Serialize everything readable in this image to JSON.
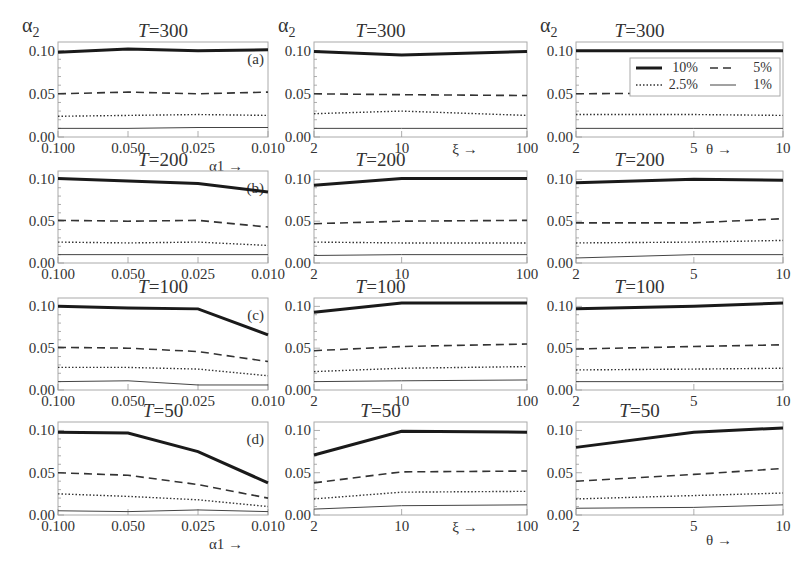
{
  "legend": {
    "entries": [
      {
        "label": "10%",
        "style": "thick-solid"
      },
      {
        "label": "5%",
        "style": "dashed"
      },
      {
        "label": "2.5%",
        "style": "dotted"
      },
      {
        "label": "1%",
        "style": "thin-solid"
      }
    ]
  },
  "y_axis_symbol": "α",
  "y_axis_subscript": "2",
  "y_ticks": [
    "0.00",
    "0.05",
    "0.10"
  ],
  "chart_data": [
    {
      "type": "line",
      "panel": "(a)",
      "title": "T=300",
      "title_T": "T",
      "title_val": "=300",
      "xlabel": "α1 →",
      "ylabel": "α2",
      "categories": [
        "0.100",
        "0.050",
        "0.025",
        "0.010"
      ],
      "ylim": [
        0,
        0.11
      ],
      "series": [
        {
          "name": "10%",
          "values": [
            0.098,
            0.102,
            0.1,
            0.101
          ]
        },
        {
          "name": "5%",
          "values": [
            0.05,
            0.052,
            0.05,
            0.052
          ]
        },
        {
          "name": "2.5%",
          "values": [
            0.024,
            0.025,
            0.026,
            0.025
          ]
        },
        {
          "name": "1%",
          "values": [
            0.01,
            0.01,
            0.011,
            0.011
          ]
        }
      ]
    },
    {
      "type": "line",
      "title": "T=300",
      "title_T": "T",
      "title_val": "=300",
      "xlabel": "ξ →",
      "ylabel": "α2",
      "categories": [
        "2",
        "10",
        "100"
      ],
      "ylim": [
        0,
        0.11
      ],
      "series": [
        {
          "name": "10%",
          "values": [
            0.099,
            0.095,
            0.099
          ]
        },
        {
          "name": "5%",
          "values": [
            0.05,
            0.049,
            0.048
          ]
        },
        {
          "name": "2.5%",
          "values": [
            0.027,
            0.03,
            0.025
          ]
        },
        {
          "name": "1%",
          "values": [
            0.01,
            0.01,
            0.01
          ]
        }
      ]
    },
    {
      "type": "line",
      "title": "T=300",
      "title_T": "T",
      "title_val": "=300",
      "xlabel": "θ →",
      "ylabel": "α2",
      "categories": [
        "2",
        "5",
        "10"
      ],
      "ylim": [
        0,
        0.11
      ],
      "series": [
        {
          "name": "10%",
          "values": [
            0.1,
            0.1,
            0.1
          ]
        },
        {
          "name": "5%",
          "values": [
            0.05,
            0.051,
            0.052
          ]
        },
        {
          "name": "2.5%",
          "values": [
            0.026,
            0.026,
            0.025
          ]
        },
        {
          "name": "1%",
          "values": [
            0.01,
            0.01,
            0.01
          ]
        }
      ]
    },
    {
      "type": "line",
      "panel": "(b)",
      "title": "T=200",
      "title_T": "T",
      "title_val": "=200",
      "xlabel": "α1 →",
      "ylabel": "α2",
      "categories": [
        "0.100",
        "0.050",
        "0.025",
        "0.010"
      ],
      "ylim": [
        0,
        0.11
      ],
      "series": [
        {
          "name": "10%",
          "values": [
            0.101,
            0.098,
            0.095,
            0.085
          ]
        },
        {
          "name": "5%",
          "values": [
            0.051,
            0.05,
            0.051,
            0.043
          ]
        },
        {
          "name": "2.5%",
          "values": [
            0.025,
            0.024,
            0.025,
            0.021
          ]
        },
        {
          "name": "1%",
          "values": [
            0.01,
            0.01,
            0.01,
            0.01
          ]
        }
      ]
    },
    {
      "type": "line",
      "title": "T=200",
      "title_T": "T",
      "title_val": "=200",
      "xlabel": "ξ →",
      "ylabel": "α2",
      "categories": [
        "2",
        "10",
        "100"
      ],
      "ylim": [
        0,
        0.11
      ],
      "series": [
        {
          "name": "10%",
          "values": [
            0.093,
            0.101,
            0.101
          ]
        },
        {
          "name": "5%",
          "values": [
            0.047,
            0.05,
            0.051
          ]
        },
        {
          "name": "2.5%",
          "values": [
            0.025,
            0.024,
            0.024
          ]
        },
        {
          "name": "1%",
          "values": [
            0.009,
            0.01,
            0.01
          ]
        }
      ]
    },
    {
      "type": "line",
      "title": "T=200",
      "title_T": "T",
      "title_val": "=200",
      "xlabel": "θ →",
      "ylabel": "α2",
      "categories": [
        "2",
        "5",
        "10"
      ],
      "ylim": [
        0,
        0.11
      ],
      "series": [
        {
          "name": "10%",
          "values": [
            0.096,
            0.1,
            0.099
          ]
        },
        {
          "name": "5%",
          "values": [
            0.048,
            0.048,
            0.053
          ]
        },
        {
          "name": "2.5%",
          "values": [
            0.024,
            0.025,
            0.027
          ]
        },
        {
          "name": "1%",
          "values": [
            0.006,
            0.01,
            0.01
          ]
        }
      ]
    },
    {
      "type": "line",
      "panel": "(c)",
      "title": "T=100",
      "title_T": "T",
      "title_val": "=100",
      "xlabel": "α1 →",
      "ylabel": "α2",
      "categories": [
        "0.100",
        "0.050",
        "0.025",
        "0.010"
      ],
      "ylim": [
        0,
        0.11
      ],
      "series": [
        {
          "name": "10%",
          "values": [
            0.1,
            0.098,
            0.097,
            0.066
          ]
        },
        {
          "name": "5%",
          "values": [
            0.051,
            0.05,
            0.046,
            0.034
          ]
        },
        {
          "name": "2.5%",
          "values": [
            0.027,
            0.027,
            0.025,
            0.017
          ]
        },
        {
          "name": "1%",
          "values": [
            0.01,
            0.011,
            0.006,
            0.006
          ]
        }
      ]
    },
    {
      "type": "line",
      "title": "T=100",
      "title_T": "T",
      "title_val": "=100",
      "xlabel": "ξ →",
      "ylabel": "α2",
      "categories": [
        "2",
        "10",
        "100"
      ],
      "ylim": [
        0,
        0.11
      ],
      "series": [
        {
          "name": "10%",
          "values": [
            0.093,
            0.104,
            0.104
          ]
        },
        {
          "name": "5%",
          "values": [
            0.047,
            0.052,
            0.055
          ]
        },
        {
          "name": "2.5%",
          "values": [
            0.022,
            0.026,
            0.028
          ]
        },
        {
          "name": "1%",
          "values": [
            0.01,
            0.011,
            0.012
          ]
        }
      ]
    },
    {
      "type": "line",
      "title": "T=100",
      "title_T": "T",
      "title_val": "=100",
      "xlabel": "θ →",
      "ylabel": "α2",
      "categories": [
        "2",
        "5",
        "10"
      ],
      "ylim": [
        0,
        0.11
      ],
      "series": [
        {
          "name": "10%",
          "values": [
            0.097,
            0.1,
            0.104
          ]
        },
        {
          "name": "5%",
          "values": [
            0.049,
            0.052,
            0.054
          ]
        },
        {
          "name": "2.5%",
          "values": [
            0.024,
            0.025,
            0.026
          ]
        },
        {
          "name": "1%",
          "values": [
            0.01,
            0.01,
            0.01
          ]
        }
      ]
    },
    {
      "type": "line",
      "panel": "(d)",
      "title": "T=50",
      "title_T": "T",
      "title_val": "=50",
      "xlabel": "α1 →",
      "ylabel": "α2",
      "categories": [
        "0.100",
        "0.050",
        "0.025",
        "0.010"
      ],
      "ylim": [
        0,
        0.11
      ],
      "series": [
        {
          "name": "10%",
          "values": [
            0.098,
            0.097,
            0.075,
            0.038
          ]
        },
        {
          "name": "5%",
          "values": [
            0.05,
            0.047,
            0.036,
            0.02
          ]
        },
        {
          "name": "2.5%",
          "values": [
            0.025,
            0.022,
            0.018,
            0.01
          ]
        },
        {
          "name": "1%",
          "values": [
            0.005,
            0.004,
            0.006,
            0.004
          ]
        }
      ]
    },
    {
      "type": "line",
      "title": "T=50",
      "title_T": "T",
      "title_val": "=50",
      "xlabel": "ξ →",
      "ylabel": "α2",
      "categories": [
        "2",
        "10",
        "100"
      ],
      "ylim": [
        0,
        0.11
      ],
      "series": [
        {
          "name": "10%",
          "values": [
            0.071,
            0.099,
            0.098
          ]
        },
        {
          "name": "5%",
          "values": [
            0.038,
            0.051,
            0.052
          ]
        },
        {
          "name": "2.5%",
          "values": [
            0.019,
            0.027,
            0.028
          ]
        },
        {
          "name": "1%",
          "values": [
            0.007,
            0.011,
            0.012
          ]
        }
      ]
    },
    {
      "type": "line",
      "title": "T=50",
      "title_T": "T",
      "title_val": "=50",
      "xlabel": "θ →",
      "ylabel": "α2",
      "categories": [
        "2",
        "5",
        "10"
      ],
      "ylim": [
        0,
        0.11
      ],
      "series": [
        {
          "name": "10%",
          "values": [
            0.08,
            0.098,
            0.103
          ]
        },
        {
          "name": "5%",
          "values": [
            0.04,
            0.048,
            0.055
          ]
        },
        {
          "name": "2.5%",
          "values": [
            0.019,
            0.023,
            0.026
          ]
        },
        {
          "name": "1%",
          "values": [
            0.008,
            0.009,
            0.012
          ]
        }
      ]
    }
  ]
}
